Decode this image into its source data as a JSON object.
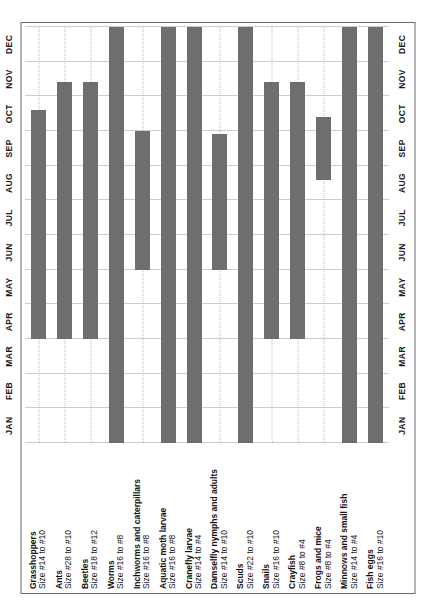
{
  "figure": {
    "orientation": "rotated-90-ccw",
    "bar_color": "#6e6e6e",
    "grid_color": "#9a9a9a",
    "frame_color": "#6a6a6a"
  },
  "months": [
    "JAN",
    "FEB",
    "MAR",
    "APR",
    "MAY",
    "JUN",
    "JUL",
    "AUG",
    "SEP",
    "OCT",
    "NOV",
    "DEC"
  ],
  "chart_data": {
    "type": "bar",
    "title": "",
    "subtitle": "",
    "xlabel": "",
    "ylabel": "",
    "orientation": "horizontal",
    "grid": true,
    "legend": "none",
    "x_categories": [
      "JAN",
      "FEB",
      "MAR",
      "APR",
      "MAY",
      "JUN",
      "JUL",
      "AUG",
      "SEP",
      "OCT",
      "NOV",
      "DEC"
    ],
    "xlim": [
      0,
      12
    ],
    "note": "Each bar is a seasonal availability span (Gantt-style). start/end are month indices, 0 = start of JAN, 12 = end of DEC.",
    "categories": [
      "Grasshoppers",
      "Ants",
      "Beetles",
      "Worms",
      "Inchworms and caterpillars",
      "Aquatic moth larvae",
      "Cranefly larvae",
      "Damselfly nymphs and adults",
      "Scuds",
      "Snails",
      "Crayfish",
      "Frogs and mice",
      "Minnows and small fish",
      "Fish eggs"
    ],
    "series": [
      {
        "name": "Availability span (months)",
        "bars": [
          {
            "label": "Grasshoppers",
            "start": 3,
            "end": 9.6
          },
          {
            "label": "Ants",
            "start": 3,
            "end": 10.4
          },
          {
            "label": "Beetles",
            "start": 3,
            "end": 10.4
          },
          {
            "label": "Worms",
            "start": 0,
            "end": 12
          },
          {
            "label": "Inchworms and caterpillars",
            "start": 5,
            "end": 9
          },
          {
            "label": "Aquatic moth larvae",
            "start": 0,
            "end": 12
          },
          {
            "label": "Cranefly larvae",
            "start": 0,
            "end": 12
          },
          {
            "label": "Damselfly nymphs and adults",
            "start": 5,
            "end": 8.9
          },
          {
            "label": "Scuds",
            "start": 0,
            "end": 12
          },
          {
            "label": "Snails",
            "start": 3,
            "end": 10.4
          },
          {
            "label": "Crayfish",
            "start": 3,
            "end": 10.4
          },
          {
            "label": "Frogs and mice",
            "start": 7.6,
            "end": 9.4
          },
          {
            "label": "Minnows and small fish",
            "start": 0,
            "end": 12
          },
          {
            "label": "Fish eggs",
            "start": 0,
            "end": 12
          }
        ]
      }
    ]
  },
  "rows": [
    {
      "name": "Grasshoppers",
      "size": "Size #14 to #10"
    },
    {
      "name": "Ants",
      "size": "Size #28 to #10"
    },
    {
      "name": "Beetles",
      "size": "Size #18 to #12"
    },
    {
      "name": "Worms",
      "size": "Size #16 to #8"
    },
    {
      "name": "Inchworms and caterpillars",
      "size": "Size #16 to #8"
    },
    {
      "name": "Aquatic moth larvae",
      "size": "Size #16 to #8"
    },
    {
      "name": "Cranefly larvae",
      "size": "Size #14 to #4"
    },
    {
      "name": "Damselfly nymphs and adults",
      "size": "Size #14 to #10"
    },
    {
      "name": "Scuds",
      "size": "Size #22 to #10"
    },
    {
      "name": "Snails",
      "size": "Size #16 to #10"
    },
    {
      "name": "Crayfish",
      "size": "Size #8 to #4"
    },
    {
      "name": "Frogs and mice",
      "size": "Size #8 to #4"
    },
    {
      "name": "Minnows and small fish",
      "size": "Size #14 to #4"
    },
    {
      "name": "Fish eggs",
      "size": "Size #16 to #10"
    }
  ]
}
